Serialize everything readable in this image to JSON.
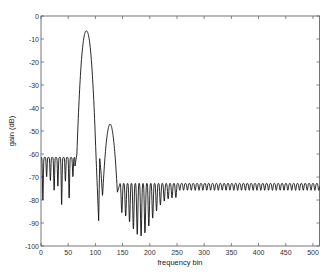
{
  "chart_data": {
    "type": "line",
    "title": "",
    "xlabel": "frequency bin",
    "ylabel": "gain (dB)",
    "xlim": [
      0,
      512
    ],
    "ylim": [
      -100,
      0
    ],
    "xticks": [
      0,
      50,
      100,
      150,
      200,
      250,
      300,
      350,
      400,
      450,
      500
    ],
    "yticks": [
      0,
      -10,
      -20,
      -30,
      -40,
      -50,
      -60,
      -70,
      -80,
      -90,
      -100
    ],
    "grid": false,
    "legend": null,
    "series": [
      {
        "name": "gain",
        "description": "Filter magnitude response: sidelobe ripple -61 to -80 dB for bins 0-62, main lobe peak -6.5 dB at bin ~83, secondary lobe peak -47 dB at bin ~127, deep null -89 dB near bin 108, stopband ripple approx -73 to -95 dB (deepest near bin 184) settling to -73/-76 dB out to bin 512",
        "key_points": [
          {
            "x": 0,
            "y": -61
          },
          {
            "x": 62,
            "y": -66
          },
          {
            "x": 66,
            "y": -60
          },
          {
            "x": 83,
            "y": -6.5
          },
          {
            "x": 101,
            "y": -60
          },
          {
            "x": 106,
            "y": -89
          },
          {
            "x": 110,
            "y": -62
          },
          {
            "x": 113,
            "y": -78
          },
          {
            "x": 127,
            "y": -47
          },
          {
            "x": 140,
            "y": -77
          },
          {
            "x": 145,
            "y": -73
          },
          {
            "x": 184,
            "y": -95
          },
          {
            "x": 250,
            "y": -74
          },
          {
            "x": 512,
            "y": -74
          }
        ]
      }
    ]
  }
}
